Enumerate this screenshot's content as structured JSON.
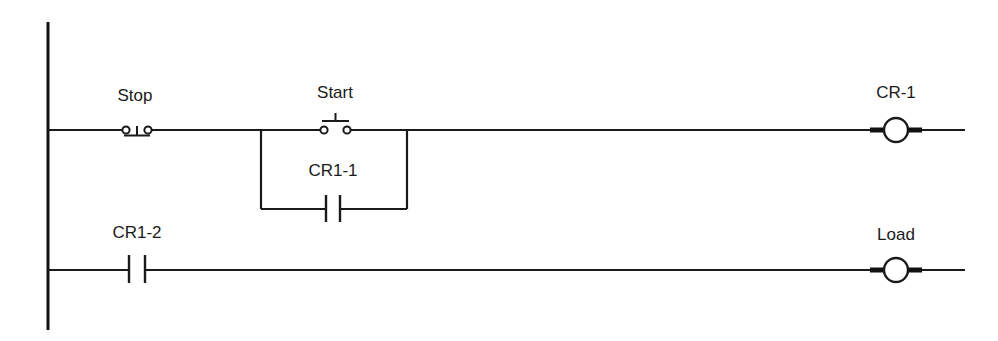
{
  "diagram": {
    "type": "ladder-logic",
    "rungs": [
      {
        "id": "rung-1",
        "elements": [
          {
            "kind": "pushbutton-nc",
            "label": "Stop"
          },
          {
            "kind": "pushbutton-no",
            "label": "Start"
          },
          {
            "kind": "contact-no",
            "label": "CR1-1",
            "parallel_with": "Start"
          },
          {
            "kind": "coil",
            "label": "CR-1"
          }
        ]
      },
      {
        "id": "rung-2",
        "elements": [
          {
            "kind": "contact-no",
            "label": "CR1-2"
          },
          {
            "kind": "coil",
            "label": "Load"
          }
        ]
      }
    ]
  },
  "labels": {
    "stop": "Stop",
    "start": "Start",
    "cr1_1": "CR1-1",
    "cr_1": "CR-1",
    "cr1_2": "CR1-2",
    "load": "Load"
  },
  "colors": {
    "line": "#1a1a1a",
    "background": "#ffffff"
  }
}
